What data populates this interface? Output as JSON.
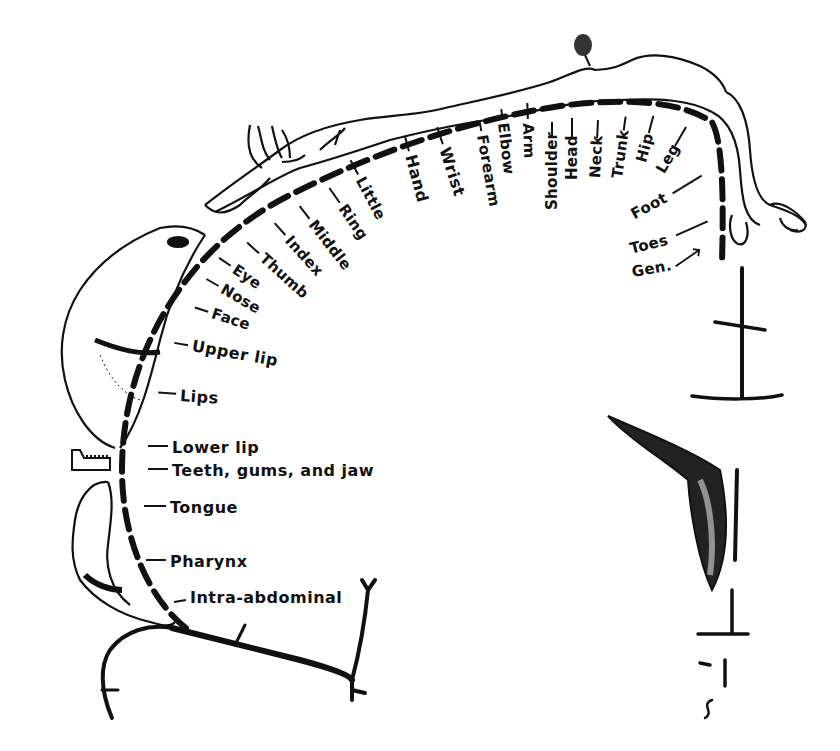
{
  "diagram": {
    "type": "sensory homunculus",
    "labels_top": [
      "Little",
      "Hand",
      "Wrist",
      "Forearm",
      "Elbow",
      "Arm",
      "Shoulder",
      "Head",
      "Neck",
      "Trunk",
      "Hip",
      "Leg"
    ],
    "labels_right": [
      "Foot",
      "Toes",
      "Gen."
    ],
    "labels_fingers_face": [
      "Ring",
      "Middle",
      "Index",
      "Thumb",
      "Eye",
      "Nose",
      "Face"
    ],
    "labels_left": [
      "Upper lip",
      "Lips",
      "Lower lip",
      "Teeth, gums, and jaw",
      "Tongue",
      "Pharynx",
      "Intra-abdominal"
    ]
  },
  "labels": {
    "little": "Little",
    "hand": "Hand",
    "wrist": "Wrist",
    "forearm": "Forearm",
    "elbow": "Elbow",
    "arm": "Arm",
    "shoulder": "Shoulder",
    "head": "Head",
    "neck": "Neck",
    "trunk": "Trunk",
    "hip": "Hip",
    "leg": "Leg",
    "foot": "Foot",
    "toes": "Toes",
    "gen": "Gen.",
    "ring": "Ring",
    "middle": "Middle",
    "index": "Index",
    "thumb": "Thumb",
    "eye": "Eye",
    "nose": "Nose",
    "face": "Face",
    "upper_lip": "Upper lip",
    "lips": "Lips",
    "lower_lip": "Lower lip",
    "teeth": "Teeth, gums, and jaw",
    "tongue": "Tongue",
    "pharynx": "Pharynx",
    "intra_abdominal": "Intra-abdominal"
  }
}
